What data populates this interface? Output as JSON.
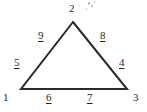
{
  "figure": {
    "name": "labeled-triangle",
    "background_color": "#ffffff",
    "stroke_color": "#2b2b2b",
    "text_color": "#242424",
    "width": 147,
    "height": 112
  },
  "geometry": {
    "apex": {
      "x": 73,
      "y": 22
    },
    "left_vertex": {
      "x": 21,
      "y": 89
    },
    "right_vertex": {
      "x": 127,
      "y": 89
    },
    "stroke_width": 2
  },
  "vertex_labels": [
    {
      "id": "vertex-2",
      "text": "2",
      "x": 69,
      "y": 3,
      "underlined": false
    },
    {
      "id": "vertex-1",
      "text": "1",
      "x": 3,
      "y": 92,
      "underlined": false
    },
    {
      "id": "vertex-3",
      "text": "3",
      "x": 133,
      "y": 92,
      "underlined": false
    }
  ],
  "segment_labels": [
    {
      "id": "segment-9",
      "text": "9",
      "x": 38,
      "y": 30,
      "underlined": true
    },
    {
      "id": "segment-8",
      "text": "8",
      "x": 100,
      "y": 30,
      "underlined": true
    },
    {
      "id": "segment-5",
      "text": "5",
      "x": 14,
      "y": 57,
      "underlined": true
    },
    {
      "id": "segment-4",
      "text": "4",
      "x": 119,
      "y": 57,
      "underlined": true
    },
    {
      "id": "segment-6",
      "text": "6",
      "x": 46,
      "y": 92,
      "underlined": true
    },
    {
      "id": "segment-7",
      "text": "7",
      "x": 87,
      "y": 92,
      "underlined": true
    }
  ],
  "artifacts": {
    "description": "faint scan speckles",
    "color": "#b9b9b9",
    "specks": [
      {
        "x": 88,
        "y": 2,
        "w": 2,
        "h": 3
      },
      {
        "x": 91,
        "y": 5,
        "w": 2,
        "h": 2
      },
      {
        "x": 86,
        "y": 8,
        "w": 1,
        "h": 2
      },
      {
        "x": 94,
        "y": 1,
        "w": 1,
        "h": 2
      },
      {
        "x": 79,
        "y": 5,
        "w": 1,
        "h": 1
      }
    ]
  }
}
